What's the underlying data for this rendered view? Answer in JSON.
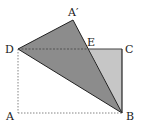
{
  "diagram": {
    "type": "geometry-fold",
    "points": {
      "A": {
        "label": "A",
        "x": 18,
        "y": 113
      },
      "B": {
        "label": "B",
        "x": 122,
        "y": 113
      },
      "C": {
        "label": "C",
        "x": 122,
        "y": 49
      },
      "D": {
        "label": "D",
        "x": 18,
        "y": 49
      },
      "A_prime": {
        "label": "A′",
        "x": 73,
        "y": 20
      },
      "E": {
        "label": "E",
        "x": 89,
        "y": 49
      }
    },
    "colors": {
      "folded_triangle": "#8c8c8c",
      "remaining_triangle": "#c6c6c6",
      "stroke": "#222222",
      "dashed": "#555555"
    }
  }
}
